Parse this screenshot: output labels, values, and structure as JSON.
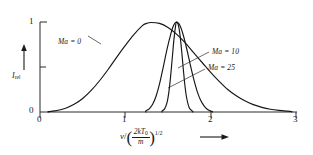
{
  "figure": {
    "background_color": "#ffffff",
    "line_color": "#161616",
    "axis_color": "#2b2b2b"
  },
  "axes": {
    "x": {
      "tick_labels": [
        "0",
        "1",
        "2",
        "3"
      ],
      "tick_values": [
        0,
        1,
        2,
        3
      ],
      "minor_ticks": [],
      "range": [
        0,
        3
      ],
      "label_parts": {
        "variable": "v",
        "slash": "/",
        "numerator": "2kT",
        "numerator_sub": "0",
        "denominator": "m",
        "exponent": "1/2",
        "arrow": "⟶"
      }
    },
    "y": {
      "tick_labels": [
        "0",
        "1"
      ],
      "tick_values": [
        0,
        1
      ],
      "minor_tick_values": [
        0.5
      ],
      "range": [
        0,
        1.12
      ],
      "label_main": "I",
      "label_sub": "rel",
      "arrow": "↑"
    }
  },
  "curve_labels": [
    {
      "id": "ma0",
      "text": "Ma = 0",
      "x": 58,
      "y": 38
    },
    {
      "id": "ma10",
      "text": "Ma = 10",
      "x": 212,
      "y": 53
    },
    {
      "id": "ma25",
      "text": "Ma = 25",
      "x": 208,
      "y": 68
    }
  ],
  "chart_data": {
    "type": "line",
    "title": "",
    "subtitle": "",
    "xlabel": "v / (2kT0/m)^(1/2)",
    "ylabel": "I_rel",
    "xlim": [
      0,
      3
    ],
    "ylim": [
      0,
      1.12
    ],
    "grid": false,
    "legend_position": "inline-annotations",
    "annotations": [
      "Ma = 0",
      "Ma = 10",
      "Ma = 25"
    ],
    "x_ticks": [
      0,
      1,
      2,
      3
    ],
    "y_ticks": [
      0,
      1
    ],
    "series": [
      {
        "name": "Ma = 0",
        "label": "Ma = 0",
        "peak_x": 1.25,
        "peak_y": 1.0,
        "fwhm": 1.15,
        "x_start": 0.1,
        "x_end": 2.95,
        "x": [
          0.1,
          0.2,
          0.3,
          0.4,
          0.5,
          0.6,
          0.7,
          0.8,
          0.9,
          1.0,
          1.1,
          1.2,
          1.25,
          1.3,
          1.4,
          1.5,
          1.6,
          1.7,
          1.8,
          1.9,
          2.0,
          2.1,
          2.2,
          2.3,
          2.4,
          2.5,
          2.6,
          2.7,
          2.8,
          2.9,
          2.95
        ],
        "y": [
          0.004,
          0.016,
          0.042,
          0.085,
          0.15,
          0.24,
          0.35,
          0.475,
          0.61,
          0.74,
          0.86,
          0.96,
          0.985,
          0.995,
          0.985,
          0.94,
          0.865,
          0.77,
          0.66,
          0.55,
          0.44,
          0.34,
          0.25,
          0.18,
          0.124,
          0.082,
          0.052,
          0.031,
          0.018,
          0.009,
          0.005
        ]
      },
      {
        "name": "Ma = 10",
        "label": "Ma = 10",
        "peak_x": 1.6,
        "peak_y": 1.0,
        "fwhm": 0.33,
        "x_start": 1.24,
        "x_end": 2.02,
        "x": [
          1.24,
          1.28,
          1.32,
          1.36,
          1.4,
          1.44,
          1.48,
          1.52,
          1.56,
          1.6,
          1.64,
          1.68,
          1.72,
          1.76,
          1.8,
          1.84,
          1.88,
          1.92,
          1.96,
          2.0,
          2.02
        ],
        "y": [
          0.012,
          0.035,
          0.085,
          0.175,
          0.31,
          0.48,
          0.66,
          0.82,
          0.95,
          0.998,
          0.96,
          0.85,
          0.7,
          0.53,
          0.37,
          0.235,
          0.135,
          0.07,
          0.03,
          0.01,
          0.005
        ]
      },
      {
        "name": "Ma = 25",
        "label": "Ma = 25",
        "peak_x": 1.6,
        "peak_y": 1.0,
        "fwhm": 0.14,
        "x_start": 1.43,
        "x_end": 1.79,
        "x": [
          1.43,
          1.46,
          1.49,
          1.51,
          1.53,
          1.55,
          1.57,
          1.59,
          1.6,
          1.62,
          1.64,
          1.66,
          1.68,
          1.7,
          1.72,
          1.75,
          1.79
        ],
        "y": [
          0.01,
          0.035,
          0.11,
          0.22,
          0.39,
          0.6,
          0.81,
          0.965,
          0.998,
          0.97,
          0.86,
          0.68,
          0.47,
          0.28,
          0.15,
          0.045,
          0.008
        ]
      }
    ]
  }
}
